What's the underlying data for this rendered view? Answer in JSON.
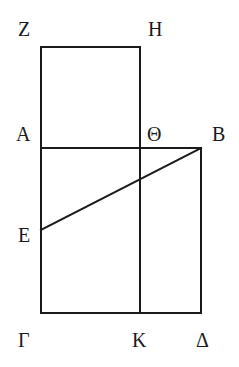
{
  "diagram": {
    "type": "geometric-figure",
    "points": {
      "Z": "Z",
      "H": "H",
      "A": "A",
      "Theta": "Θ",
      "B": "B",
      "E": "E",
      "Gamma": "Γ",
      "K": "K",
      "Delta": "Δ"
    },
    "segments": [
      "ZH",
      "ZA",
      "HΘ",
      "AB",
      "AΓ",
      "ΘK",
      "BΔ",
      "ΓΔ",
      "EB"
    ],
    "line_color": "#1a1a1a",
    "background": "#ffffff"
  }
}
